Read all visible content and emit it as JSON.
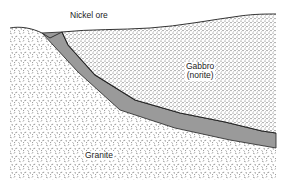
{
  "diagram": {
    "type": "geologic-cross-section",
    "labels": {
      "ore": "Nickel ore",
      "gabbro_line1": "Gabbro",
      "gabbro_line2": "(norite)",
      "granite": "Granite"
    },
    "units": [
      {
        "name": "Granite",
        "pattern": "dashes",
        "role": "country rock"
      },
      {
        "name": "Nickel ore",
        "pattern": "solid gray",
        "color": "#9a9a9a",
        "role": "ore band at base of intrusion"
      },
      {
        "name": "Gabbro (norite)",
        "pattern": "fine dots",
        "role": "intrusive body"
      }
    ],
    "colors": {
      "ore_fill": "#9a9a9a",
      "outline": "#333333",
      "pattern_ink": "#555555",
      "background": "#ffffff"
    }
  }
}
